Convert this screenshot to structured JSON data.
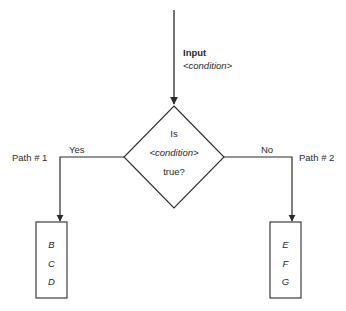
{
  "diagram": {
    "type": "flowchart-decision",
    "input": {
      "title": "Input",
      "subtitle": "<condition>"
    },
    "decision": {
      "line1": "Is",
      "line2": "<condition>",
      "line3": "true?"
    },
    "branches": {
      "yes": {
        "edge_label": "Yes",
        "path_label": "Path # 1",
        "items": [
          "B",
          "C",
          "D"
        ]
      },
      "no": {
        "edge_label": "No",
        "path_label": "Path # 2",
        "items": [
          "E",
          "F",
          "G"
        ]
      }
    },
    "colors": {
      "stroke": "#2a2a2a",
      "background": "#ffffff"
    }
  }
}
